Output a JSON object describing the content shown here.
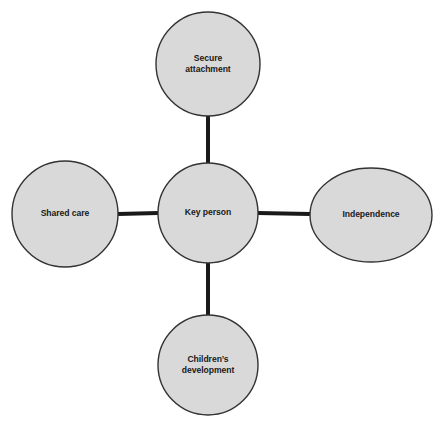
{
  "diagram": {
    "type": "hub-and-spoke",
    "background_color": "#ffffff",
    "node_fill_color": "#d9d9d9",
    "node_border_color": "#333333",
    "connector_color": "#1a1a1a",
    "label_color": "#1a1a1a",
    "center": {
      "id": "key-person",
      "label": "Key person",
      "shape": "circle",
      "cx": 208,
      "cy": 213,
      "rx": 50,
      "ry": 50
    },
    "nodes": [
      {
        "id": "secure-attachment",
        "label": "Secure\nattachment",
        "shape": "circle",
        "position": "top",
        "cx": 208,
        "cy": 64,
        "rx": 52,
        "ry": 52
      },
      {
        "id": "shared-care",
        "label": "Shared care",
        "shape": "circle",
        "position": "left",
        "cx": 65,
        "cy": 214,
        "rx": 53,
        "ry": 53
      },
      {
        "id": "independence",
        "label": "Independence",
        "shape": "ellipse",
        "position": "right",
        "cx": 371,
        "cy": 215,
        "rx": 61,
        "ry": 47
      },
      {
        "id": "childrens-development",
        "label": "Children’s\ndevelopment",
        "shape": "circle",
        "position": "bottom",
        "cx": 208,
        "cy": 365,
        "rx": 50,
        "ry": 50
      }
    ],
    "connectors": [
      {
        "id": "key-person-to-secure-attachment",
        "x1": 208,
        "y1": 163,
        "x2": 208,
        "y2": 116
      },
      {
        "id": "key-person-to-shared-care",
        "x1": 158,
        "y1": 213,
        "x2": 118,
        "y2": 214
      },
      {
        "id": "key-person-to-independence",
        "x1": 258,
        "y1": 213,
        "x2": 310,
        "y2": 214
      },
      {
        "id": "key-person-to-childrens-development",
        "x1": 208,
        "y1": 263,
        "x2": 208,
        "y2": 315
      }
    ]
  }
}
